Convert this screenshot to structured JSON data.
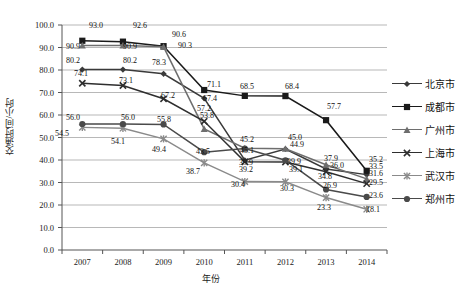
{
  "chart_data": {
    "type": "line",
    "title": "",
    "xlabel": "年份",
    "ylabel": "交通时间/小时",
    "categories": [
      "2007",
      "2008",
      "2009",
      "2010",
      "2011",
      "2012",
      "2013",
      "2014"
    ],
    "ylim": [
      0,
      100
    ],
    "ytick_step": 10,
    "ytick_labels": [
      "0.0",
      "10.0",
      "20.0",
      "30.0",
      "40.0",
      "50.0",
      "60.0",
      "70.0",
      "80.0",
      "90.0",
      "100.0"
    ],
    "grid": true,
    "legend_position": "right",
    "series": [
      {
        "name": "北京市",
        "marker": "diamond",
        "color": "#3a3a3a",
        "values": [
          80.2,
          80.2,
          78.3,
          67.4,
          39.9,
          44.9,
          36.0,
          33.5
        ]
      },
      {
        "name": "成都市",
        "marker": "square",
        "color": "#1a1a1a",
        "values": [
          93.0,
          92.6,
          90.6,
          71.1,
          68.5,
          68.4,
          57.7,
          35.2
        ]
      },
      {
        "name": "广州市",
        "marker": "triangle",
        "color": "#6e6e6e",
        "values": [
          90.9,
          90.9,
          90.3,
          53.8,
          45.2,
          45.0,
          37.9,
          31.6
        ]
      },
      {
        "name": "上海市",
        "marker": "cross",
        "color": "#2e2e2e",
        "values": [
          74.1,
          73.1,
          67.2,
          57.2,
          39.2,
          39.1,
          34.8,
          29.5
        ]
      },
      {
        "name": "武汉市",
        "marker": "star",
        "color": "#8a8a8a",
        "values": [
          54.5,
          54.1,
          49.4,
          38.7,
          30.4,
          30.3,
          23.3,
          18.1
        ]
      },
      {
        "name": "郑州市",
        "marker": "circle",
        "color": "#4a4a4a",
        "values": [
          56.0,
          56.0,
          55.8,
          43.5,
          45.1,
          39.9,
          26.9,
          23.6
        ]
      }
    ],
    "point_labels": [
      {
        "text": "93.0",
        "x": 89,
        "y": 22
      },
      {
        "text": "92.6",
        "x": 133,
        "y": 22
      },
      {
        "text": "90.6",
        "x": 172,
        "y": 31
      },
      {
        "text": "90.3",
        "x": 178,
        "y": 42
      },
      {
        "text": "90.9",
        "x": 66,
        "y": 43
      },
      {
        "text": "90.9",
        "x": 123,
        "y": 43
      },
      {
        "text": "80.2",
        "x": 66,
        "y": 57
      },
      {
        "text": "80.2",
        "x": 123,
        "y": 57
      },
      {
        "text": "78.3",
        "x": 152,
        "y": 59
      },
      {
        "text": "74.1",
        "x": 74,
        "y": 70
      },
      {
        "text": "73.1",
        "x": 119,
        "y": 77
      },
      {
        "text": "67.2",
        "x": 161,
        "y": 92
      },
      {
        "text": "71.1",
        "x": 207,
        "y": 81
      },
      {
        "text": "67.4",
        "x": 203,
        "y": 95
      },
      {
        "text": "57.2",
        "x": 197,
        "y": 105
      },
      {
        "text": "53.8",
        "x": 200,
        "y": 112
      },
      {
        "text": "68.5",
        "x": 240,
        "y": 83
      },
      {
        "text": "68.4",
        "x": 285,
        "y": 83
      },
      {
        "text": "57.7",
        "x": 327,
        "y": 103
      },
      {
        "text": "56.0",
        "x": 66,
        "y": 114
      },
      {
        "text": "56.0",
        "x": 121,
        "y": 114
      },
      {
        "text": "55.8",
        "x": 157,
        "y": 116
      },
      {
        "text": "54.5",
        "x": 55,
        "y": 130
      },
      {
        "text": "54.1",
        "x": 111,
        "y": 138
      },
      {
        "text": "49.4",
        "x": 152,
        "y": 146
      },
      {
        "text": "43.5",
        "x": 196,
        "y": 148
      },
      {
        "text": "38.7",
        "x": 186,
        "y": 168
      },
      {
        "text": "45.2",
        "x": 240,
        "y": 136
      },
      {
        "text": "45.1",
        "x": 240,
        "y": 147
      },
      {
        "text": "39.9",
        "x": 239,
        "y": 159
      },
      {
        "text": "39.2",
        "x": 239,
        "y": 166
      },
      {
        "text": "30.4",
        "x": 231,
        "y": 181
      },
      {
        "text": "45.0",
        "x": 288,
        "y": 134
      },
      {
        "text": "44.9",
        "x": 290,
        "y": 141
      },
      {
        "text": "39.9",
        "x": 287,
        "y": 158
      },
      {
        "text": "39.1",
        "x": 289,
        "y": 166
      },
      {
        "text": "30.3",
        "x": 280,
        "y": 185
      },
      {
        "text": "37.9",
        "x": 324,
        "y": 155
      },
      {
        "text": "36.0",
        "x": 330,
        "y": 162
      },
      {
        "text": "34.8",
        "x": 318,
        "y": 173
      },
      {
        "text": "26.9",
        "x": 323,
        "y": 182
      },
      {
        "text": "23.3",
        "x": 317,
        "y": 204
      },
      {
        "text": "35.2",
        "x": 369,
        "y": 156
      },
      {
        "text": "33.5",
        "x": 369,
        "y": 163
      },
      {
        "text": "31.6",
        "x": 369,
        "y": 170
      },
      {
        "text": "29.5",
        "x": 369,
        "y": 179
      },
      {
        "text": "23.6",
        "x": 369,
        "y": 192
      },
      {
        "text": "18.1",
        "x": 366,
        "y": 206
      }
    ]
  }
}
